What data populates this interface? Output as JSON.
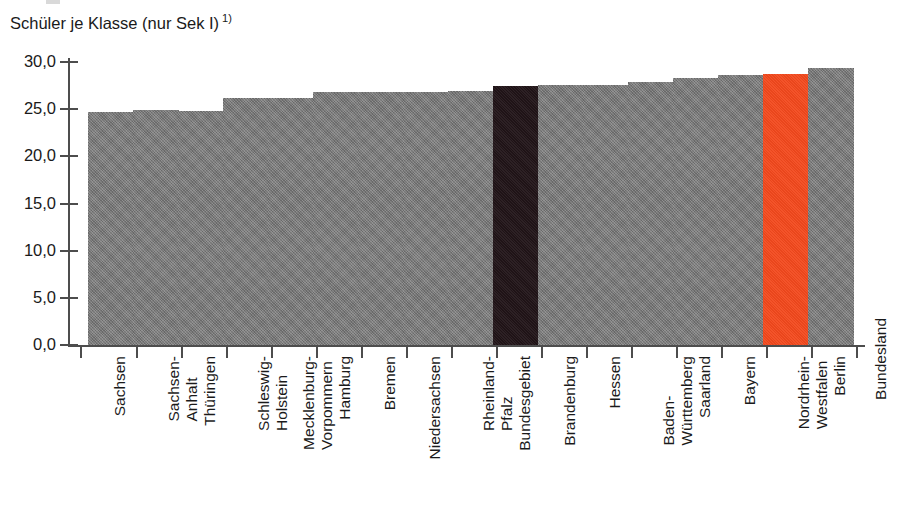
{
  "chart_data": {
    "type": "bar",
    "title_main": "Schüler je Klasse (nur Sek I)",
    "title_footnote": "1)",
    "xlabel": "Bundesland",
    "ylabel": "",
    "ylim": [
      0,
      30
    ],
    "grid": false,
    "legend": "none",
    "y_ticks": [
      "0,0",
      "5,0",
      "10,0",
      "15,0",
      "20,0",
      "25,0",
      "30,0"
    ],
    "y_tick_values": [
      0,
      5,
      10,
      15,
      20,
      25,
      30
    ],
    "categories": [
      "Sachsen",
      "Sachsen-Anhalt",
      "Thüringen",
      "Schleswig-Holstein",
      "Mecklenburg-Vorpommern",
      "Hamburg",
      "Bremen",
      "Niedersachsen",
      "Rheinland-Pfalz",
      "Bundesgebiet",
      "Brandenburg",
      "Hessen",
      "Baden-Württemberg",
      "Saarland",
      "Bayern",
      "Nordrhein-Westfalen",
      "Berlin"
    ],
    "category_lines": [
      [
        "Sachsen"
      ],
      [
        "Sachsen-",
        "Anhalt"
      ],
      [
        "Thüringen"
      ],
      [
        "Schleswig-",
        "Holstein"
      ],
      [
        "Mecklenburg-",
        "Vorpommern"
      ],
      [
        "Hamburg"
      ],
      [
        "Bremen"
      ],
      [
        "Niedersachsen"
      ],
      [
        "Rheinland-",
        "Pfalz"
      ],
      [
        "Bundesgebiet"
      ],
      [
        "Brandenburg"
      ],
      [
        "Hessen"
      ],
      [
        "Baden-",
        "Württemberg"
      ],
      [
        "Saarland"
      ],
      [
        "Bayern"
      ],
      [
        "Nordrhein-",
        "Westfalen"
      ],
      [
        "Berlin"
      ]
    ],
    "values": [
      24.7,
      24.9,
      24.8,
      26.2,
      26.2,
      26.8,
      26.8,
      26.8,
      26.9,
      27.5,
      27.6,
      27.6,
      27.9,
      28.3,
      28.6,
      28.7,
      29.4
    ],
    "bar_styles": [
      "normal",
      "normal",
      "normal",
      "normal",
      "normal",
      "normal",
      "normal",
      "normal",
      "normal",
      "dark",
      "normal",
      "normal",
      "normal",
      "normal",
      "normal",
      "accent",
      "normal"
    ]
  },
  "colors": {
    "bar_default": "#7c7c7c",
    "bar_dark": "#221519",
    "bar_accent": "#f3491d",
    "axis": "#4d4d4d",
    "text": "#1a1a1a",
    "background": "#ffffff"
  }
}
